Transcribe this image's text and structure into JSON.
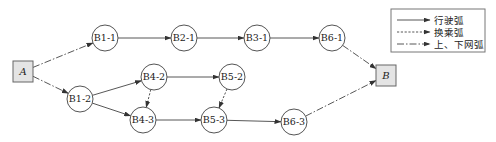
{
  "diagram": {
    "terminals": [
      {
        "id": "A",
        "label": "A",
        "x": 13,
        "y": 61,
        "w": 20,
        "h": 21
      },
      {
        "id": "B",
        "label": "B",
        "x": 376,
        "y": 65,
        "w": 20,
        "h": 21
      }
    ],
    "nodes": [
      {
        "id": "B1-1",
        "label": "B1-1",
        "cx": 105,
        "cy": 38,
        "r": 13
      },
      {
        "id": "B2-1",
        "label": "B2-1",
        "cx": 184,
        "cy": 38,
        "r": 13
      },
      {
        "id": "B3-1",
        "label": "B3-1",
        "cx": 257,
        "cy": 38,
        "r": 13
      },
      {
        "id": "B6-1",
        "label": "B6-1",
        "cx": 332,
        "cy": 38,
        "r": 13
      },
      {
        "id": "B1-2",
        "label": "B1-2",
        "cx": 80,
        "cy": 99,
        "r": 13
      },
      {
        "id": "B4-2",
        "label": "B4-2",
        "cx": 154,
        "cy": 77,
        "r": 13
      },
      {
        "id": "B5-2",
        "label": "B5-2",
        "cx": 232,
        "cy": 77,
        "r": 13
      },
      {
        "id": "B4-3",
        "label": "B4-3",
        "cx": 143,
        "cy": 120,
        "r": 13
      },
      {
        "id": "B5-3",
        "label": "B5-3",
        "cx": 214,
        "cy": 120,
        "r": 13
      },
      {
        "id": "B6-3",
        "label": "B6-3",
        "cx": 294,
        "cy": 122,
        "r": 13
      }
    ],
    "edges": [
      {
        "from": "A",
        "to": "B1-1",
        "type": "access"
      },
      {
        "from": "A",
        "to": "B1-2",
        "type": "access"
      },
      {
        "from": "B1-1",
        "to": "B2-1",
        "type": "drive"
      },
      {
        "from": "B2-1",
        "to": "B3-1",
        "type": "drive"
      },
      {
        "from": "B3-1",
        "to": "B6-1",
        "type": "drive"
      },
      {
        "from": "B6-1",
        "to": "B",
        "type": "access"
      },
      {
        "from": "B1-2",
        "to": "B4-2",
        "type": "drive"
      },
      {
        "from": "B1-2",
        "to": "B4-3",
        "type": "drive"
      },
      {
        "from": "B4-2",
        "to": "B5-2",
        "type": "drive"
      },
      {
        "from": "B4-2",
        "to": "B4-3",
        "type": "transfer"
      },
      {
        "from": "B5-2",
        "to": "B5-3",
        "type": "transfer"
      },
      {
        "from": "B4-3",
        "to": "B5-3",
        "type": "drive"
      },
      {
        "from": "B5-3",
        "to": "B6-3",
        "type": "drive"
      },
      {
        "from": "B6-3",
        "to": "B",
        "type": "access"
      }
    ]
  },
  "legend": {
    "items": [
      {
        "type": "drive",
        "label": "行驶弧"
      },
      {
        "type": "transfer",
        "label": "换乘弧"
      },
      {
        "type": "access",
        "label": "上、下网弧"
      }
    ]
  },
  "colors": {
    "line": "#444444",
    "box_fill": "#e4e4e4",
    "box_stroke": "#666666"
  }
}
